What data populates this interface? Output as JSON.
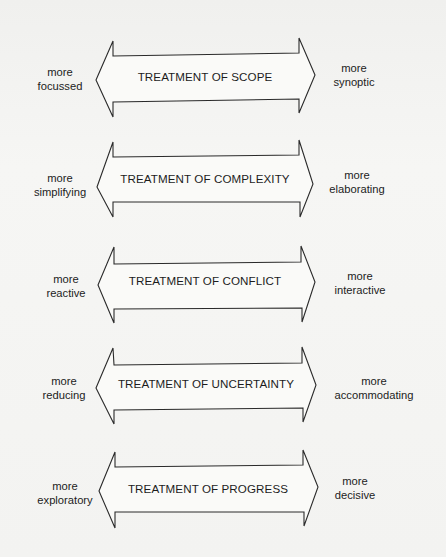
{
  "diagram": {
    "rows": [
      {
        "title": "TREATMENT OF SCOPE",
        "left": {
          "line1": "more",
          "line2": "focussed"
        },
        "right": {
          "line1": "more",
          "line2": "synoptic"
        }
      },
      {
        "title": "TREATMENT OF COMPLEXITY",
        "left": {
          "line1": "more",
          "line2": "simplifying"
        },
        "right": {
          "line1": "more",
          "line2": "elaborating"
        }
      },
      {
        "title": "TREATMENT OF CONFLICT",
        "left": {
          "line1": "more",
          "line2": "reactive"
        },
        "right": {
          "line1": "more",
          "line2": "interactive"
        }
      },
      {
        "title": "TREATMENT OF UNCERTAINTY",
        "left": {
          "line1": "more",
          "line2": "reducing"
        },
        "right": {
          "line1": "more",
          "line2": "accommodating"
        }
      },
      {
        "title": "TREATMENT OF PROGRESS",
        "left": {
          "line1": "more",
          "line2": "exploratory"
        },
        "right": {
          "line1": "more",
          "line2": "decisive"
        }
      }
    ],
    "colors": {
      "stroke": "#2a2a2a",
      "text": "#1c1c1c",
      "paper": "#f4f4f2"
    }
  }
}
